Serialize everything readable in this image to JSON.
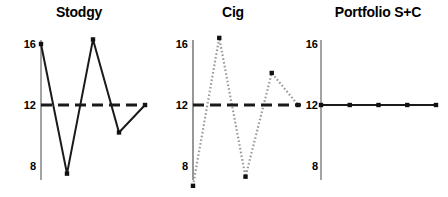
{
  "figure": {
    "background_color": "#ffffff",
    "ink_color": "#1a1a1a",
    "faint_color": "#9a9a9a"
  },
  "chart_data": [
    {
      "type": "line",
      "title": "Stodgy",
      "xlabel": "",
      "ylabel": "",
      "ylim": [
        6.2,
        17.0
      ],
      "yticks": [
        8,
        12,
        16
      ],
      "ytick_labels": [
        "8",
        "12",
        "16"
      ],
      "grid": false,
      "legend": "none",
      "x": [
        0,
        1,
        2,
        3,
        4
      ],
      "series": [
        {
          "name": "Stodgy",
          "values": [
            16.0,
            7.5,
            16.3,
            10.2,
            12.0
          ],
          "line_style": "solid",
          "color": "#1a1a1a",
          "marker": "square"
        },
        {
          "name": "reference level 12",
          "values": [
            12,
            12,
            12,
            12,
            12
          ],
          "line_style": "dashed",
          "color": "#1a1a1a",
          "marker": "none"
        }
      ]
    },
    {
      "type": "line",
      "title": "Cig",
      "xlabel": "",
      "ylabel": "",
      "ylim": [
        6.2,
        17.0
      ],
      "yticks": [
        8,
        12,
        16
      ],
      "ytick_labels": [
        "8",
        "12",
        "16"
      ],
      "grid": false,
      "legend": "none",
      "x": [
        0,
        1,
        2,
        3,
        4
      ],
      "series": [
        {
          "name": "Cig",
          "values": [
            6.7,
            16.4,
            7.3,
            14.1,
            12.0
          ],
          "line_style": "dotted",
          "color": "#9a9a9a",
          "marker": "square"
        },
        {
          "name": "reference level 12",
          "values": [
            12,
            12,
            12,
            12,
            12
          ],
          "line_style": "dashed",
          "color": "#1a1a1a",
          "marker": "none"
        }
      ]
    },
    {
      "type": "line",
      "title": "Portfolio S+C",
      "xlabel": "",
      "ylabel": "",
      "ylim": [
        6.2,
        17.0
      ],
      "yticks": [
        8,
        12,
        16
      ],
      "ytick_labels": [
        "8",
        "12",
        "16"
      ],
      "grid": false,
      "legend": "none",
      "x": [
        0,
        1,
        2,
        3,
        4
      ],
      "series": [
        {
          "name": "Portfolio S+C",
          "values": [
            12.0,
            12.0,
            12.0,
            12.0,
            12.0
          ],
          "line_style": "solid",
          "color": "#1a1a1a",
          "marker": "square"
        }
      ]
    }
  ]
}
